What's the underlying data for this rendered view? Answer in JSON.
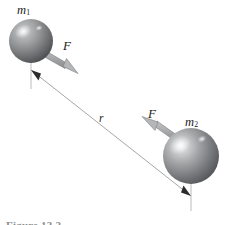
{
  "figure": {
    "background_color": "#ffffff",
    "caption": "Figure 13.2",
    "labels": {
      "mass_one": "m",
      "mass_one_sub": "1",
      "mass_two": "m",
      "mass_two_sub": "2",
      "force_one": "F",
      "force_two": "F",
      "separation": "r"
    },
    "colors": {
      "sphere_mid": "#8f9092",
      "sphere_dark": "#4a4b4d",
      "sphere_highlight": "#e6e7e8",
      "arrow_fill": "#a9abad",
      "arrow_edge": "#7e8082",
      "line": "#9a9c9e",
      "text": "#1a1a1a",
      "caption": "#8d8d8d"
    },
    "elements": {
      "sphere_one": {
        "cx": 31,
        "cy": 41,
        "r": 22
      },
      "sphere_two": {
        "cx": 191,
        "cy": 156,
        "r": 28
      },
      "force_arrow_one": {
        "from_x": 44,
        "from_y": 52,
        "to_x": 77,
        "to_y": 72,
        "direction": "down-right"
      },
      "force_arrow_two": {
        "from_x": 177,
        "from_y": 140,
        "to_x": 143,
        "to_y": 117,
        "direction": "up-left"
      },
      "separation_line": {
        "from_x": 31,
        "from_y": 70,
        "to_x": 191,
        "to_y": 196,
        "arrowheads": "both"
      },
      "tick_one": {
        "x": 31,
        "y1": 62,
        "y2": 88
      },
      "tick_two": {
        "x": 191,
        "y1": 180,
        "y2": 210
      }
    }
  }
}
